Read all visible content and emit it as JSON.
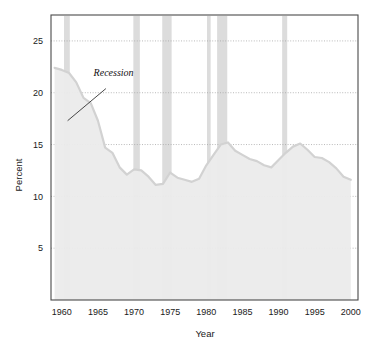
{
  "chart_data": {
    "type": "area",
    "title": "",
    "xlabel": "Year",
    "ylabel": "Percent",
    "xlim": [
      1958.5,
      2001
    ],
    "ylim": [
      0,
      27.5
    ],
    "grid": true,
    "grid_style": "dotted-horizontal",
    "legend": "none",
    "xticks": [
      1960,
      1965,
      1970,
      1975,
      1980,
      1985,
      1990,
      1995,
      2000
    ],
    "xtick_labels": [
      "1960",
      "1965",
      "1970",
      "1975",
      "1980",
      "1985",
      "1990",
      "1995",
      "2000"
    ],
    "yticks": [
      5,
      10,
      15,
      20,
      25
    ],
    "ytick_labels": [
      "5",
      "10",
      "15",
      "20",
      "25"
    ],
    "series": [
      {
        "name": "Percent",
        "fill_color": "#ebebeb",
        "line_color": "#d2d2d2",
        "x": [
          1959,
          1960,
          1961,
          1962,
          1963,
          1964,
          1965,
          1966,
          1967,
          1968,
          1969,
          1970,
          1971,
          1972,
          1973,
          1974,
          1975,
          1976,
          1977,
          1978,
          1979,
          1980,
          1981,
          1982,
          1983,
          1984,
          1985,
          1986,
          1987,
          1988,
          1989,
          1990,
          1991,
          1992,
          1993,
          1994,
          1995,
          1996,
          1997,
          1998,
          1999,
          2000
        ],
        "values": [
          22.4,
          22.2,
          21.9,
          21.0,
          19.5,
          19.0,
          17.3,
          14.7,
          14.2,
          12.8,
          12.1,
          12.6,
          12.5,
          11.9,
          11.1,
          11.2,
          12.3,
          11.8,
          11.6,
          11.4,
          11.7,
          13.0,
          14.0,
          15.0,
          15.2,
          14.4,
          14.0,
          13.6,
          13.4,
          13.0,
          12.8,
          13.5,
          14.2,
          14.8,
          15.1,
          14.5,
          13.8,
          13.7,
          13.3,
          12.7,
          11.9,
          11.6
        ]
      }
    ],
    "recession_bands": [
      {
        "start": 1960.3,
        "end": 1961.1
      },
      {
        "start": 1969.9,
        "end": 1970.8
      },
      {
        "start": 1973.9,
        "end": 1975.2
      },
      {
        "start": 1980.1,
        "end": 1980.6
      },
      {
        "start": 1981.5,
        "end": 1982.9
      },
      {
        "start": 1990.5,
        "end": 1991.2
      }
    ],
    "band_color": "#dcdcdc",
    "annotations": [
      {
        "text": "Recession",
        "label_x": 1964.4,
        "label_y": 21.6,
        "leader_from_x": 1966.1,
        "leader_from_y": 20.4,
        "leader_to_x": 1960.8,
        "leader_to_y": 17.3
      }
    ]
  }
}
